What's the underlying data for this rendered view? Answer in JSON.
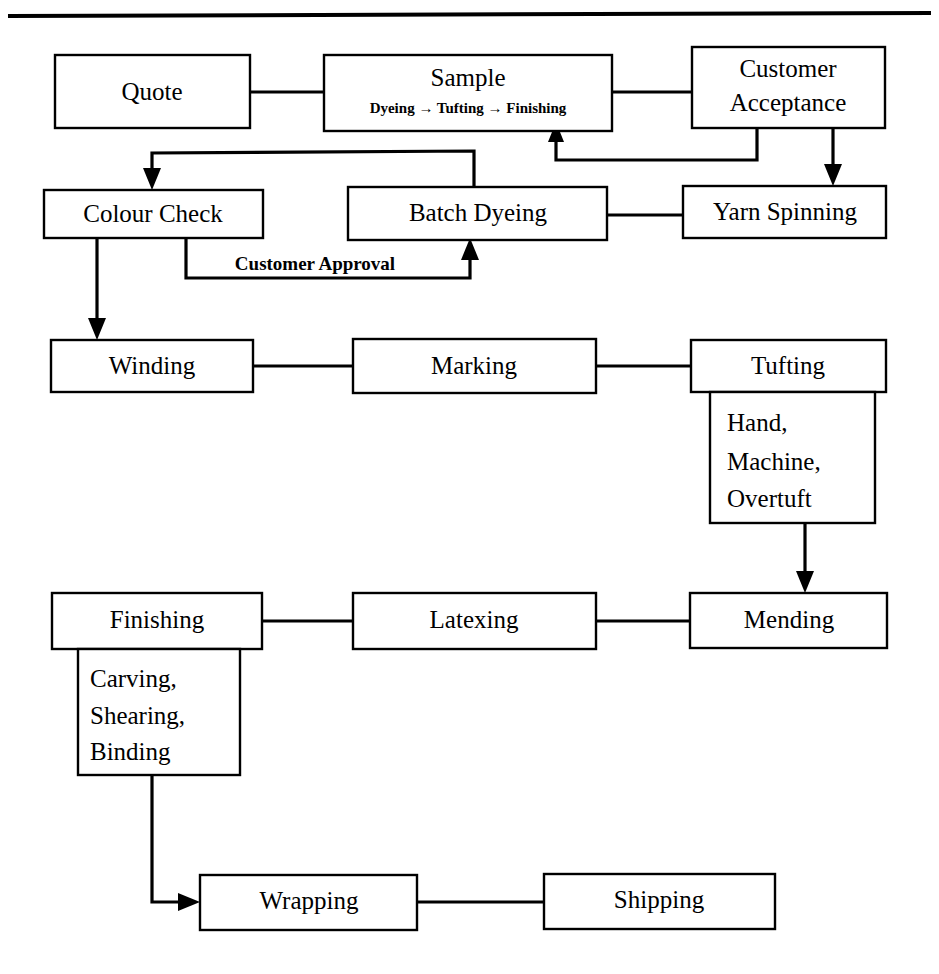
{
  "document": {
    "type": "process-flowchart",
    "title": "Carpet Manufacturing Process Flow",
    "top_rule": true
  },
  "nodes": {
    "quote": {
      "label": "Quote"
    },
    "sample": {
      "label": "Sample",
      "sublabel": "Dyeing → Tufting → Finishing"
    },
    "customer_acceptance": {
      "label_line1": "Customer",
      "label_line2": "Acceptance"
    },
    "colour_check": {
      "label": "Colour Check"
    },
    "batch_dyeing": {
      "label": "Batch Dyeing"
    },
    "yarn_spinning": {
      "label": "Yarn Spinning"
    },
    "winding": {
      "label": "Winding"
    },
    "marking": {
      "label": "Marking"
    },
    "tufting": {
      "label": "Tufting",
      "details": [
        "Hand,",
        "Machine,",
        "Overtuft"
      ]
    },
    "mending": {
      "label": "Mending"
    },
    "latexing": {
      "label": "Latexing"
    },
    "finishing": {
      "label": "Finishing",
      "details": [
        "Carving,",
        "Shearing,",
        "Binding"
      ]
    },
    "wrapping": {
      "label": "Wrapping"
    },
    "shipping": {
      "label": "Shipping"
    }
  },
  "edge_labels": {
    "customer_approval": "Customer Approval"
  },
  "sample_steps": [
    "Dyeing",
    "Tufting",
    "Finishing"
  ],
  "colors": {
    "stroke": "#000000",
    "fill": "#ffffff",
    "text": "#000000"
  }
}
